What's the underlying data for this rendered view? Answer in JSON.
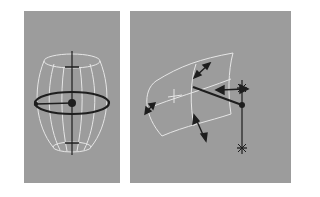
{
  "figure": {
    "panels": [
      {
        "id": "left",
        "subject": "barrel-shaped wireframe with radial manipulator",
        "elements": [
          "wireframe-barrel",
          "vertical-axis",
          "top-tick",
          "bottom-tick",
          "horizontal-ellipse-ring",
          "radius-handle",
          "center-pivot"
        ]
      },
      {
        "id": "right",
        "subject": "curved surface patch with directional arrows and pivot handle",
        "elements": [
          "curved-surface-patch",
          "center-cross",
          "direction-arrows",
          "handle-line",
          "vertical-pivot-axis",
          "end-ticks"
        ]
      }
    ],
    "colors": {
      "background": "#ffffff",
      "panel": "#9c9c9c",
      "wireframe": "#e6e6e6",
      "manipulator": "#1e1e1e"
    }
  }
}
